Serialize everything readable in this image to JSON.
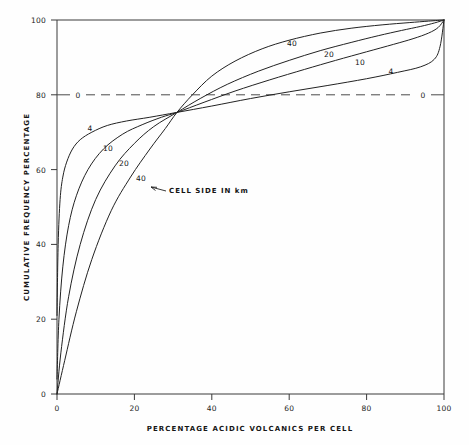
{
  "chart_data": {
    "type": "line",
    "title": "",
    "xlabel": "PERCENTAGE ACIDIC VOLCANICS PER CELL",
    "ylabel": "CUMULATIVE FREQUENCY PERCENTAGE",
    "xlim": [
      0,
      100
    ],
    "ylim": [
      0,
      100
    ],
    "xticks": [
      "0",
      "20",
      "40",
      "60",
      "80",
      "100"
    ],
    "yticks": [
      "0",
      "20",
      "40",
      "60",
      "80",
      "100"
    ],
    "grid": false,
    "legend_position": "inline-curve-labels",
    "legend_title": "CELL SIDE IN km",
    "series": [
      {
        "name": "4",
        "label": "4",
        "cell_side_km": 4,
        "x": [
          0,
          0.3,
          0.8,
          1.5,
          2.5,
          4,
          6,
          9,
          13,
          18,
          24,
          31,
          40,
          50,
          60,
          70,
          80,
          88,
          94,
          97.5,
          99,
          100
        ],
        "y": [
          21,
          40,
          52,
          58,
          62,
          65.5,
          68,
          70,
          71.8,
          73,
          74,
          75.3,
          77,
          79,
          80.8,
          82.5,
          84.3,
          86,
          87.5,
          89.5,
          93,
          100
        ]
      },
      {
        "name": "10",
        "label": "10",
        "cell_side_km": 10,
        "x": [
          0,
          0.5,
          1.5,
          3,
          5,
          8,
          12,
          17,
          22,
          27,
          31,
          38,
          46,
          55,
          64,
          72,
          80,
          87,
          92,
          96,
          98.5,
          100
        ],
        "y": [
          4,
          20,
          34,
          45,
          53,
          60,
          65.5,
          69.5,
          72,
          74,
          75.3,
          78,
          81,
          84,
          86.8,
          89.2,
          91.5,
          93.5,
          95,
          96.5,
          98,
          100
        ]
      },
      {
        "name": "20",
        "label": "20",
        "cell_side_km": 20,
        "x": [
          0,
          1,
          3,
          6,
          10,
          15,
          20,
          25,
          31,
          37,
          44,
          52,
          60,
          68,
          76,
          83,
          89,
          94,
          97.5,
          100
        ],
        "y": [
          0,
          11,
          26,
          40,
          52,
          61,
          67,
          71.5,
          75.3,
          79,
          82.8,
          86.3,
          89.2,
          91.8,
          94,
          95.8,
          97.2,
          98.3,
          99.2,
          100
        ]
      },
      {
        "name": "40",
        "label": "40",
        "cell_side_km": 40,
        "x": [
          0,
          2,
          5,
          9,
          14,
          19,
          24,
          28,
          31,
          35,
          40,
          46,
          53,
          60,
          68,
          76,
          84,
          91,
          96,
          100
        ],
        "y": [
          0,
          9,
          22,
          36,
          49,
          58,
          65.5,
          71,
          75.3,
          80,
          85,
          89,
          92.3,
          94.6,
          96.5,
          97.8,
          98.7,
          99.3,
          99.7,
          100
        ]
      }
    ],
    "reference_line": {
      "label": "0",
      "value": 80,
      "style": "dashed",
      "left_label": "0",
      "right_label": "0"
    },
    "annotations": [
      {
        "text": "CELL SIDE IN km",
        "points_to": "40"
      }
    ],
    "curve_labels_upper": [
      {
        "text": "40",
        "x": 61,
        "y": 95.5
      },
      {
        "text": "20",
        "x": 70.5,
        "y": 92.5
      },
      {
        "text": "10",
        "x": 78.5,
        "y": 90.5
      },
      {
        "text": "4",
        "x": 86.5,
        "y": 88
      }
    ],
    "curve_labels_lower": [
      {
        "text": "4",
        "x": 7,
        "y": 70.5
      },
      {
        "text": "10",
        "x": 12,
        "y": 65.5
      },
      {
        "text": "20",
        "x": 16.5,
        "y": 62
      },
      {
        "text": "40",
        "x": 21,
        "y": 58.5
      }
    ]
  }
}
